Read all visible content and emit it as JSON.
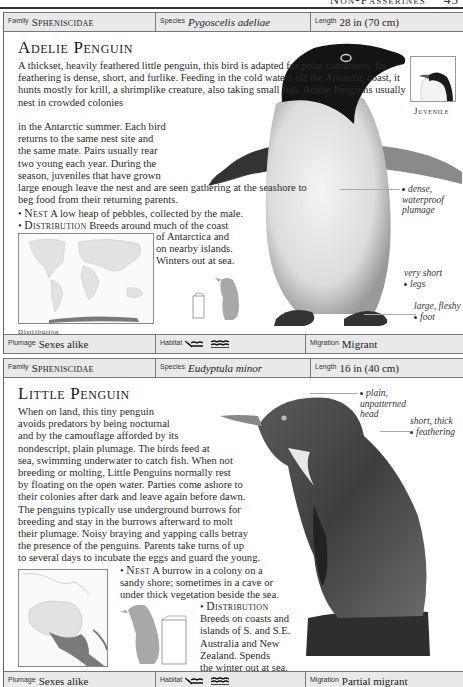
{
  "page": {
    "running_head": "Non-Passerines",
    "page_number": "43"
  },
  "entries": [
    {
      "facts_top": {
        "family_label": "Family",
        "family_value": "Spheniscidae",
        "species_label": "Species",
        "species_value": "Pygoscelis adeliae",
        "length_label": "Length",
        "length_value": "28 in (70 cm)"
      },
      "title": "Adelie Penguin",
      "body": "A thickset, heavily feathered little penguin, this bird is adapted for polar conditions. Its feathering is dense, short, and furlike. Feeding in the cold waters off the Antarctic coast, it hunts mostly for krill, a shrimplike creature, also taking small fish. Adelie Penguins usually nest in crowded colonies",
      "body_narrow": [
        "in the Antarctic summer. Each bird",
        "returns to the same nest site and",
        "the same mate. Pairs usually rear",
        "two young each year. During the",
        "season, juveniles that have grown"
      ],
      "body_wide": "large enough leave the nest and are seen gathering at the seashore to beg food from their returning parents.",
      "nest_label": "Nest",
      "nest_text": "A low heap of pebbles, collected by the male.",
      "distribution_label": "Distribution",
      "distribution_text_1": "Breeds around much of the coast",
      "distribution_text_2": [
        "of Antarctica and",
        "on nearby islands.",
        "Winters out at sea."
      ],
      "map_caption": "Distribution",
      "juvenile_label": "Juvenile",
      "callouts": [
        {
          "text": [
            "dense,",
            "waterproof",
            "plumage"
          ]
        },
        {
          "text": [
            "very short",
            "legs"
          ]
        },
        {
          "text": [
            "large, fleshy",
            "foot"
          ]
        }
      ],
      "facts_bottom": {
        "plumage_label": "Plumage",
        "plumage_value": "Sexes alike",
        "habitat_label": "Habitat",
        "habitat_icons": [
          "coast-icon",
          "sea-icon"
        ],
        "migration_label": "Migration",
        "migration_value": "Migrant"
      }
    },
    {
      "facts_top": {
        "family_label": "Family",
        "family_value": "Spheniscidae",
        "species_label": "Species",
        "species_value": "Eudyptula minor",
        "length_label": "Length",
        "length_value": "16 in (40 cm)"
      },
      "title": "Little Penguin",
      "body_lines": [
        "When on land, this tiny penguin",
        "avoids predators by being nocturnal",
        "and by the camouflage afforded by its",
        "nondescript, plain plumage. The birds feed at",
        "sea, swimming underwater to catch fish. When not",
        "breeding or molting, Little Penguins normally rest",
        "by floating on the open water. Parties come ashore to",
        "their colonies after dark and leave again before dawn.",
        "The penguins typically use underground burrows for",
        "breeding and stay in the burrows afterward to molt",
        "their plumage. Noisy braying and yapping calls betray",
        "the presence of the penguins. Parents take turns of up",
        "to several days to incubate the eggs and guard the young."
      ],
      "nest_label": "Nest",
      "nest_lines": [
        "A burrow in a colony on a",
        "sandy shore; sometimes in a cave or",
        "under thick vegetation beside the sea."
      ],
      "distribution_label": "Distribution",
      "distribution_lines": [
        "Breeds on coasts and",
        "islands of S. and S.E.",
        "Australia and New",
        "Zealand. Spends",
        "the winter out at sea."
      ],
      "map_caption": "Distribution",
      "callouts": [
        {
          "text": [
            "plain,",
            "unpatterned",
            "head"
          ]
        },
        {
          "text": [
            "short, thick",
            "feathering"
          ]
        }
      ],
      "facts_bottom": {
        "plumage_label": "Plumage",
        "plumage_value": "Sexes alike",
        "habitat_label": "Habitat",
        "habitat_icons": [
          "coast-icon",
          "sea-icon"
        ],
        "migration_label": "Migration",
        "migration_value": "Partial migrant"
      }
    }
  ],
  "colors": {
    "bar_bg": "#e9e9e9",
    "silhouette": "#a8a8a8",
    "map_land": "#e2e2e2",
    "map_range": "#7a7a7a"
  }
}
